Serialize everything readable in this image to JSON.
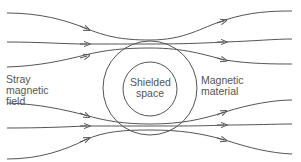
{
  "labels": {
    "stray_field": [
      "Stray",
      "magnetic",
      "field"
    ],
    "shielded_space": [
      "Shielded",
      "space"
    ],
    "magnetic_material": [
      "Magnetic",
      "material"
    ]
  },
  "colors": {
    "line": "#555555",
    "text": "#555555",
    "background": "#ffffff"
  },
  "geometry": {
    "outer_circle": {
      "cx": 150,
      "cy": 88,
      "r": 47
    },
    "inner_circle": {
      "cx": 150,
      "cy": 89,
      "r": 27
    }
  },
  "field_lines_count": 6
}
